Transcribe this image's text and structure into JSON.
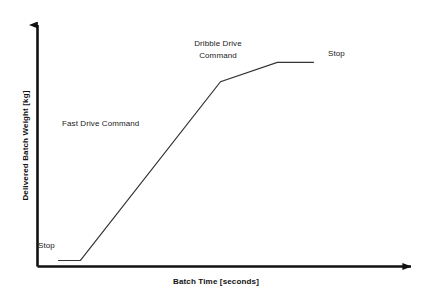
{
  "chart_data": {
    "type": "line",
    "title": "",
    "subtitle": "",
    "xlabel": "Batch Time [seconds]",
    "ylabel": "Delivered Batch Weight [kg]",
    "xlim": [
      0,
      100
    ],
    "ylim": [
      0,
      100
    ],
    "xticks": [],
    "yticks": [],
    "xticklabels": [],
    "yticklabels": [],
    "grid": false,
    "legend": false,
    "legend_position": "none",
    "axis_style": "arrow-headed open axes (no box, no tick marks)",
    "line_color": "#333333",
    "axis_color": "#111111",
    "series": [
      {
        "name": "Delivered Batch Weight",
        "comment": "Piecewise-linear batch weight profile in schematic units (0-100 on both axes)",
        "x": [
          5.5,
          11.5,
          49.0,
          64.2,
          74.0
        ],
        "y": [
          2.5,
          2.5,
          76.5,
          84.5,
          84.5
        ]
      }
    ],
    "segments": [
      {
        "name": "initial-stop-dwell",
        "label": "Stop",
        "slope": "flat",
        "x_range": [
          5.5,
          11.5
        ]
      },
      {
        "name": "fast-drive-ramp",
        "label": "Fast Drive Command",
        "slope": "steep-rise",
        "x_range": [
          11.5,
          49.0
        ]
      },
      {
        "name": "dribble-drive-ramp",
        "label": "Dribble Drive Command",
        "slope": "shallow-rise",
        "x_range": [
          49.0,
          64.2
        ]
      },
      {
        "name": "final-stop-dwell",
        "label": "Stop",
        "slope": "flat",
        "x_range": [
          64.2,
          74.0
        ]
      }
    ],
    "annotations": [
      {
        "id": "stop-start",
        "text": "Stop",
        "x": 7.0,
        "y": 9.0,
        "align": "left",
        "lines": [
          "Stop"
        ]
      },
      {
        "id": "fast-drive",
        "text": "Fast Drive Command",
        "x": 13.0,
        "y": 57.0,
        "align": "left",
        "lines": [
          "Fast Drive Command"
        ]
      },
      {
        "id": "dribble-drive",
        "text": "Dribble Drive Command",
        "x": 44.0,
        "y": 88.0,
        "align": "center",
        "lines": [
          "Dribble Drive",
          "Command"
        ]
      },
      {
        "id": "stop-end",
        "text": "Stop",
        "x": 78.0,
        "y": 84.0,
        "align": "left",
        "lines": [
          "Stop"
        ]
      }
    ]
  },
  "annotations": {
    "stop_start": "Stop",
    "fast_drive": "Fast Drive Command",
    "dribble_drive_line1": "Dribble Drive",
    "dribble_drive_line2": "Command",
    "stop_end": "Stop"
  },
  "axes": {
    "x_title": "Batch Time [seconds]",
    "y_title": "Delivered Batch Weight [kg]"
  },
  "colors": {
    "background": "#ffffff",
    "axis": "#111111",
    "curve": "#333333",
    "text": "#1a1a1a"
  }
}
